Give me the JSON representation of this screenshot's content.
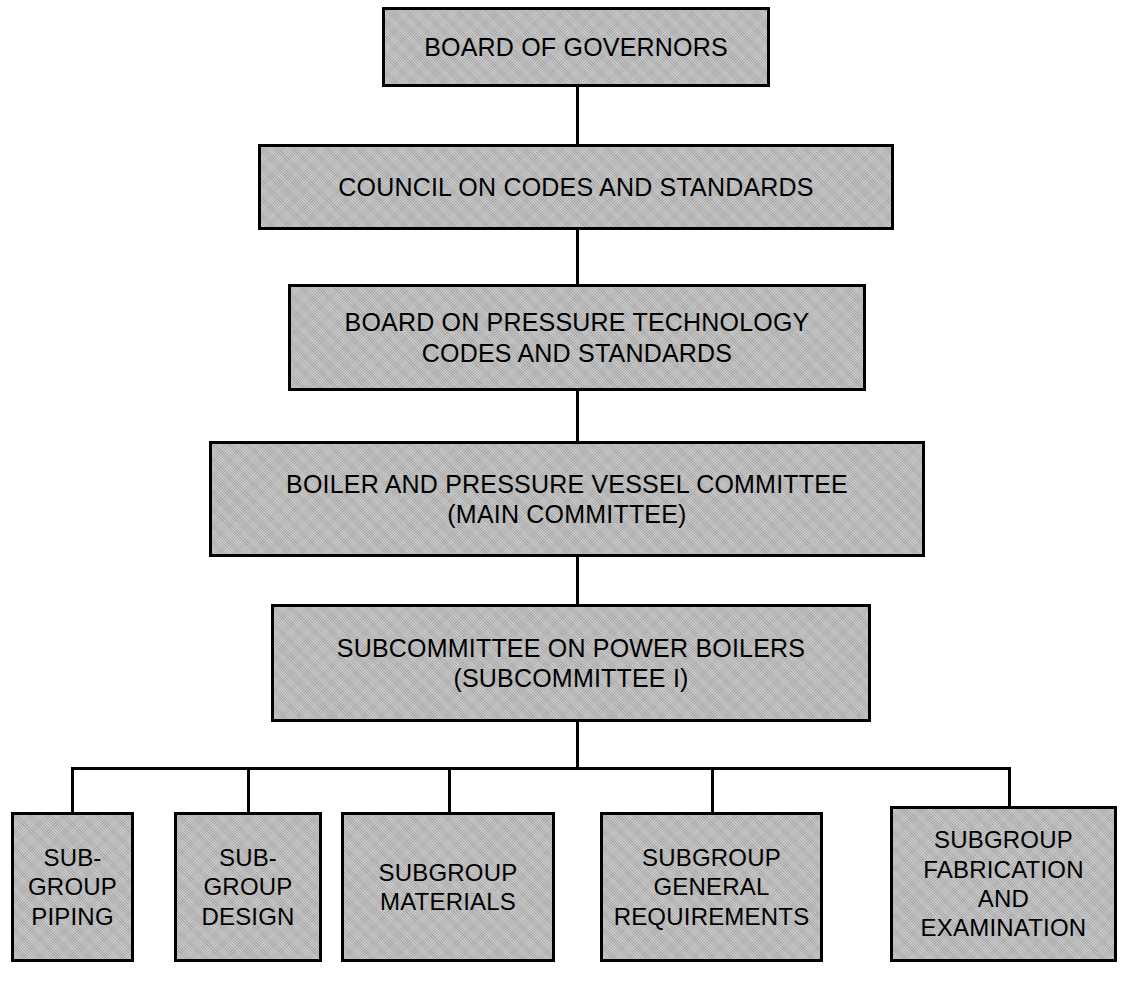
{
  "diagram": {
    "type": "organization-chart",
    "colors": {
      "node_fill": "#b9b9b9",
      "node_border": "#000000",
      "connector": "#000000",
      "background": "#ffffff",
      "text": "#000000"
    },
    "levels": [
      {
        "level": 1,
        "nodes": [
          {
            "id": "board-of-governors",
            "label": "BOARD OF GOVERNORS"
          }
        ]
      },
      {
        "level": 2,
        "nodes": [
          {
            "id": "council-on-codes-and-standards",
            "label": "COUNCIL ON CODES AND STANDARDS"
          }
        ]
      },
      {
        "level": 3,
        "nodes": [
          {
            "id": "board-on-pressure-technology",
            "label": "BOARD ON PRESSURE TECHNOLOGY\nCODES AND STANDARDS"
          }
        ]
      },
      {
        "level": 4,
        "nodes": [
          {
            "id": "boiler-and-pressure-vessel-committee",
            "label": "BOILER AND PRESSURE VESSEL COMMITTEE\n(MAIN COMMITTEE)"
          }
        ]
      },
      {
        "level": 5,
        "nodes": [
          {
            "id": "subcommittee-on-power-boilers",
            "label": "SUBCOMMITTEE ON POWER BOILERS\n(SUBCOMMITTEE I)"
          }
        ]
      },
      {
        "level": 6,
        "nodes": [
          {
            "id": "subgroup-piping",
            "label": "SUB-\nGROUP\nPIPING"
          },
          {
            "id": "subgroup-design",
            "label": "SUB-\nGROUP\nDESIGN"
          },
          {
            "id": "subgroup-materials",
            "label": "SUBGROUP\nMATERIALS"
          },
          {
            "id": "subgroup-general-requirements",
            "label": "SUBGROUP\nGENERAL\nREQUIREMENTS"
          },
          {
            "id": "subgroup-fabrication-and-examination",
            "label": "SUBGROUP\nFABRICATION\nAND\nEXAMINATION"
          }
        ]
      }
    ],
    "edges": [
      {
        "from": "board-of-governors",
        "to": "council-on-codes-and-standards"
      },
      {
        "from": "council-on-codes-and-standards",
        "to": "board-on-pressure-technology"
      },
      {
        "from": "board-on-pressure-technology",
        "to": "boiler-and-pressure-vessel-committee"
      },
      {
        "from": "boiler-and-pressure-vessel-committee",
        "to": "subcommittee-on-power-boilers"
      },
      {
        "from": "subcommittee-on-power-boilers",
        "to": "subgroup-piping"
      },
      {
        "from": "subcommittee-on-power-boilers",
        "to": "subgroup-design"
      },
      {
        "from": "subcommittee-on-power-boilers",
        "to": "subgroup-materials"
      },
      {
        "from": "subcommittee-on-power-boilers",
        "to": "subgroup-general-requirements"
      },
      {
        "from": "subcommittee-on-power-boilers",
        "to": "subgroup-fabrication-and-examination"
      }
    ]
  }
}
